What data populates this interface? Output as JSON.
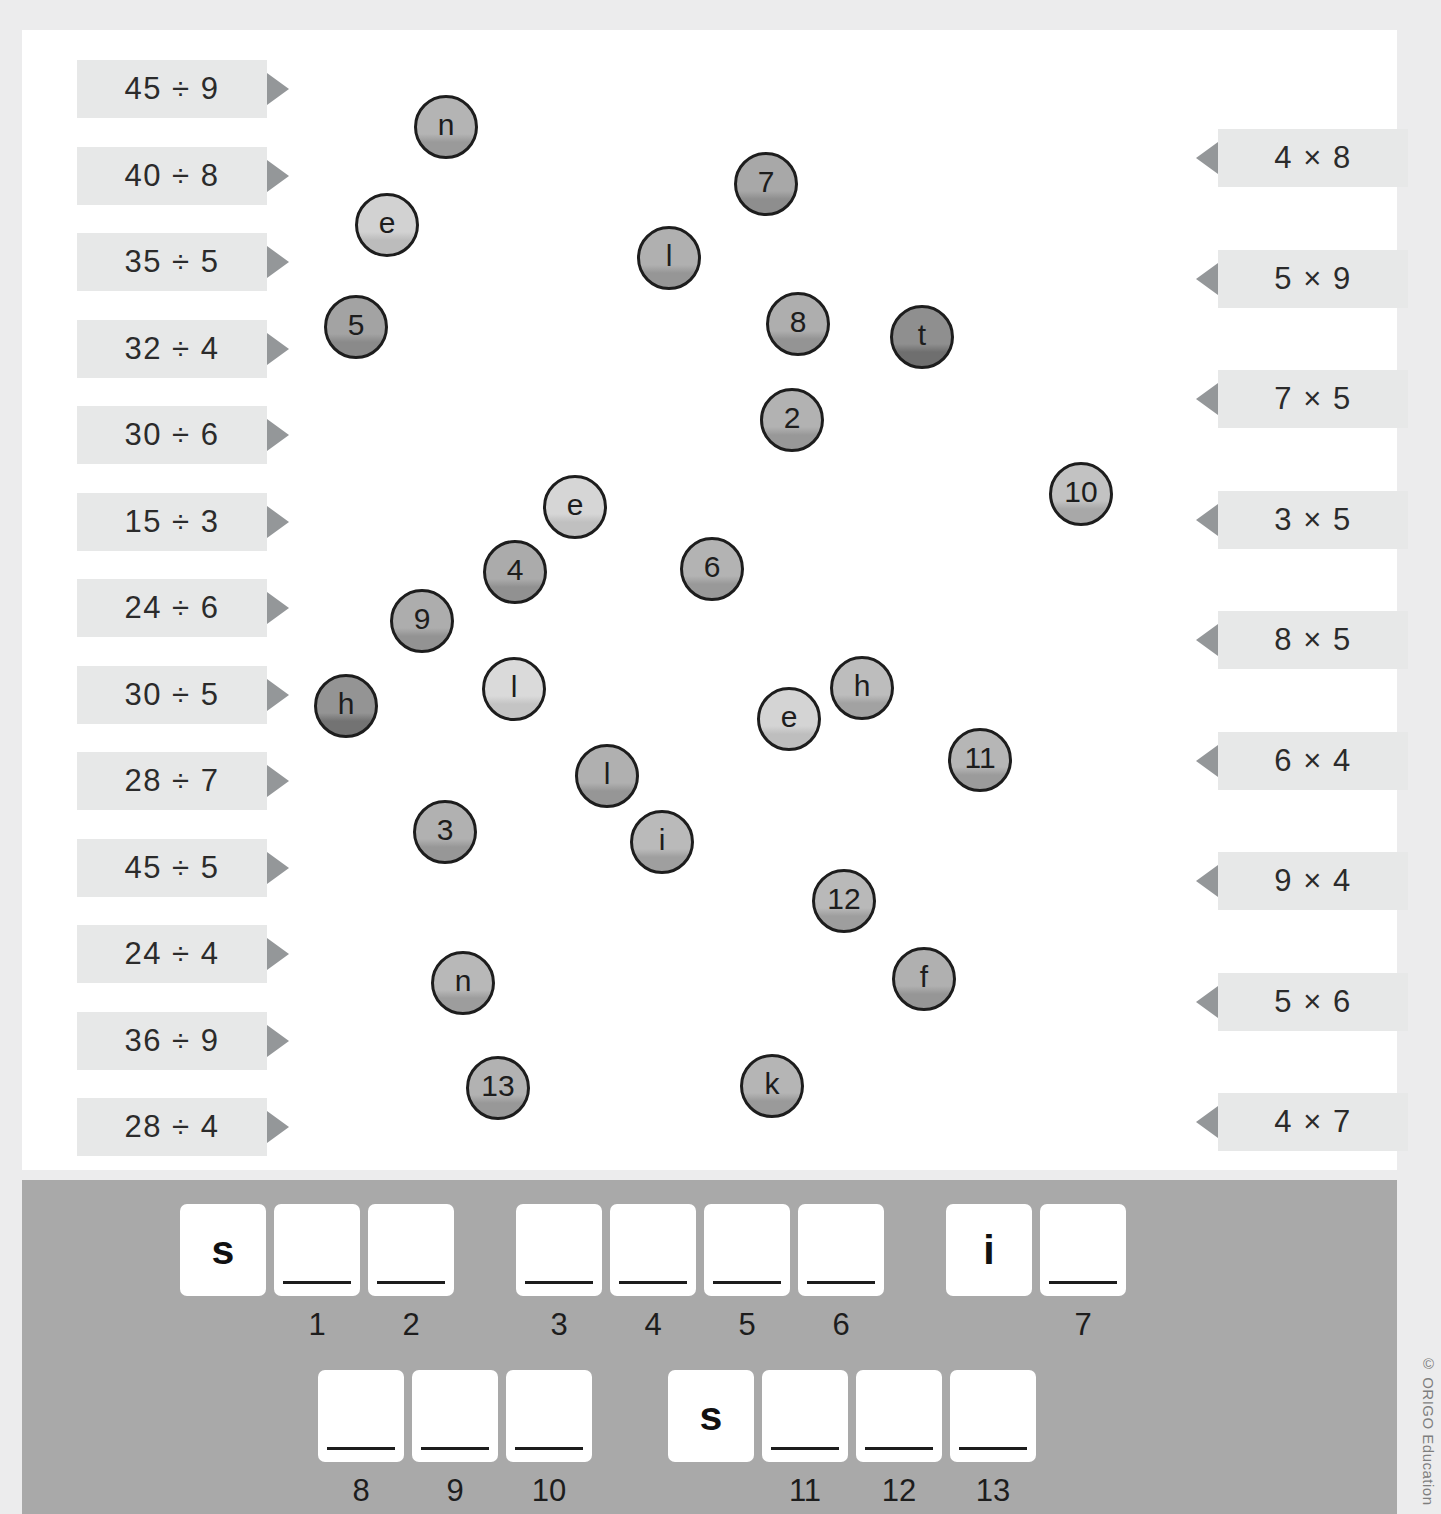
{
  "worksheet": {
    "copyright": "© ORIGO Education"
  },
  "left_column": {
    "label": "division-facts",
    "items": [
      {
        "text": "45 ÷ 9"
      },
      {
        "text": "40 ÷ 8"
      },
      {
        "text": "35 ÷ 5"
      },
      {
        "text": "32 ÷ 4"
      },
      {
        "text": "30 ÷ 6"
      },
      {
        "text": "15 ÷ 3"
      },
      {
        "text": "24 ÷ 6"
      },
      {
        "text": "30 ÷ 5"
      },
      {
        "text": "28 ÷ 7"
      },
      {
        "text": "45 ÷ 5"
      },
      {
        "text": "24 ÷ 4"
      },
      {
        "text": "36 ÷ 9"
      },
      {
        "text": "28 ÷ 4"
      }
    ]
  },
  "right_column": {
    "label": "multiplication-facts",
    "items": [
      {
        "text": "4 × 8"
      },
      {
        "text": "5 × 9"
      },
      {
        "text": "7 × 5"
      },
      {
        "text": "3 × 5"
      },
      {
        "text": "8 × 5"
      },
      {
        "text": "6 × 4"
      },
      {
        "text": "9 × 4"
      },
      {
        "text": "5 × 6"
      },
      {
        "text": "4 × 7"
      }
    ]
  },
  "discs": [
    {
      "text": "n",
      "x": 414,
      "y": 95,
      "size": 64,
      "fill": "#b4b4b4",
      "shade": "#9a9a9a"
    },
    {
      "text": "7",
      "x": 734,
      "y": 152,
      "size": 64,
      "fill": "#a8a8a8",
      "shade": "#8e8e8e"
    },
    {
      "text": "e",
      "x": 355,
      "y": 193,
      "size": 64,
      "fill": "#d2d2d2",
      "shade": "#bcbcbc"
    },
    {
      "text": "l",
      "x": 637,
      "y": 226,
      "size": 64,
      "fill": "#b0b0b0",
      "shade": "#969696"
    },
    {
      "text": "5",
      "x": 324,
      "y": 295,
      "size": 64,
      "fill": "#a3a3a3",
      "shade": "#8a8a8a"
    },
    {
      "text": "8",
      "x": 766,
      "y": 292,
      "size": 64,
      "fill": "#aeaeae",
      "shade": "#949494"
    },
    {
      "text": "t",
      "x": 890,
      "y": 305,
      "size": 64,
      "fill": "#8f8f8f",
      "shade": "#6f6f6f"
    },
    {
      "text": "2",
      "x": 760,
      "y": 388,
      "size": 64,
      "fill": "#b2b2b2",
      "shade": "#989898"
    },
    {
      "text": "10",
      "x": 1049,
      "y": 462,
      "size": 64,
      "fill": "#c2c2c2",
      "shade": "#a8a8a8"
    },
    {
      "text": "e",
      "x": 543,
      "y": 475,
      "size": 64,
      "fill": "#d6d6d6",
      "shade": "#c0c0c0"
    },
    {
      "text": "4",
      "x": 483,
      "y": 540,
      "size": 64,
      "fill": "#ababab",
      "shade": "#919191"
    },
    {
      "text": "6",
      "x": 680,
      "y": 537,
      "size": 64,
      "fill": "#b3b3b3",
      "shade": "#999999"
    },
    {
      "text": "9",
      "x": 390,
      "y": 589,
      "size": 64,
      "fill": "#adadad",
      "shade": "#939393"
    },
    {
      "text": "h",
      "x": 830,
      "y": 656,
      "size": 64,
      "fill": "#bdbdbd",
      "shade": "#a2a2a2"
    },
    {
      "text": "h",
      "x": 314,
      "y": 674,
      "size": 64,
      "fill": "#949494",
      "shade": "#737373"
    },
    {
      "text": "l",
      "x": 482,
      "y": 657,
      "size": 64,
      "fill": "#dadada",
      "shade": "#c4c4c4"
    },
    {
      "text": "e",
      "x": 757,
      "y": 687,
      "size": 64,
      "fill": "#d4d4d4",
      "shade": "#bebebe"
    },
    {
      "text": "11",
      "x": 948,
      "y": 728,
      "size": 64,
      "fill": "#b6b6b6",
      "shade": "#9b9b9b"
    },
    {
      "text": "l",
      "x": 575,
      "y": 744,
      "size": 64,
      "fill": "#b0b0b0",
      "shade": "#969696"
    },
    {
      "text": "i",
      "x": 630,
      "y": 810,
      "size": 64,
      "fill": "#bababa",
      "shade": "#9f9f9f"
    },
    {
      "text": "3",
      "x": 413,
      "y": 800,
      "size": 64,
      "fill": "#b1b1b1",
      "shade": "#979797"
    },
    {
      "text": "12",
      "x": 812,
      "y": 869,
      "size": 64,
      "fill": "#b9b9b9",
      "shade": "#9e9e9e"
    },
    {
      "text": "f",
      "x": 892,
      "y": 947,
      "size": 64,
      "fill": "#b0b0b0",
      "shade": "#969696"
    },
    {
      "text": "n",
      "x": 431,
      "y": 951,
      "size": 64,
      "fill": "#b8b8b8",
      "shade": "#9d9d9d"
    },
    {
      "text": "13",
      "x": 466,
      "y": 1056,
      "size": 64,
      "fill": "#b2b2b2",
      "shade": "#989898"
    },
    {
      "text": "k",
      "x": 740,
      "y": 1054,
      "size": 64,
      "fill": "#b5b5b5",
      "shade": "#9a9a9a"
    }
  ],
  "answer_rows": [
    {
      "name": "answer-row-1",
      "groups": [
        {
          "cells": [
            {
              "letter": "s",
              "number": ""
            },
            {
              "letter": "",
              "number": "1"
            },
            {
              "letter": "",
              "number": "2"
            }
          ]
        },
        {
          "cells": [
            {
              "letter": "",
              "number": "3"
            },
            {
              "letter": "",
              "number": "4"
            },
            {
              "letter": "",
              "number": "5"
            },
            {
              "letter": "",
              "number": "6"
            }
          ]
        },
        {
          "cells": [
            {
              "letter": "i",
              "number": ""
            },
            {
              "letter": "",
              "number": "7"
            }
          ]
        }
      ]
    },
    {
      "name": "answer-row-2",
      "groups": [
        {
          "cells": [
            {
              "letter": "",
              "number": "8"
            },
            {
              "letter": "",
              "number": "9"
            },
            {
              "letter": "",
              "number": "10"
            }
          ]
        },
        {
          "cells": [
            {
              "letter": "s",
              "number": ""
            },
            {
              "letter": "",
              "number": "11"
            },
            {
              "letter": "",
              "number": "12"
            },
            {
              "letter": "",
              "number": "13"
            }
          ]
        }
      ]
    }
  ]
}
